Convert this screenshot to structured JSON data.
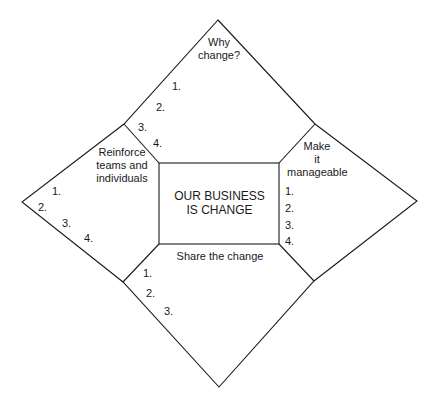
{
  "diagram": {
    "center": {
      "line1": "OUR BUSINESS",
      "line2": "IS CHANGE"
    },
    "sections": {
      "top": {
        "title_line1": "Why",
        "title_line2": "change?",
        "items": [
          "1.",
          "2.",
          "3.",
          "4."
        ]
      },
      "left": {
        "title_line1": "Reinforce",
        "title_line2": "teams and",
        "title_line3": "individuals",
        "items": [
          "1.",
          "2.",
          "3.",
          "4."
        ]
      },
      "right": {
        "title_line1": "Make",
        "title_line2": "it",
        "title_line3": "manageable",
        "items": [
          "1.",
          "2.",
          "3.",
          "4."
        ]
      },
      "bottom": {
        "title": "Share the change",
        "items": [
          "1.",
          "2.",
          "3."
        ]
      }
    },
    "colors": {
      "line": "#1a1a1a",
      "background": "#ffffff"
    }
  }
}
